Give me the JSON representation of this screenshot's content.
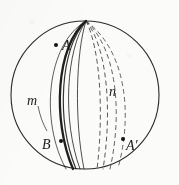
{
  "figure": {
    "caption": "",
    "background_color": "#fbfbfa",
    "ink_color": "#1f1f1f",
    "labels": [
      {
        "id": "A",
        "text": "A",
        "x": 62,
        "y": 50,
        "font_size": 14,
        "style": "italic"
      },
      {
        "id": "m",
        "text": "m",
        "x": 27,
        "y": 105,
        "font_size": 14,
        "style": "italic"
      },
      {
        "id": "B",
        "text": "B",
        "x": 42,
        "y": 149,
        "font_size": 14,
        "style": "italic"
      },
      {
        "id": "n",
        "text": "n",
        "x": 109,
        "y": 96,
        "font_size": 14,
        "style": "italic"
      },
      {
        "id": "Aprime",
        "text": "A′",
        "x": 126,
        "y": 150,
        "font_size": 14,
        "style": "italic"
      }
    ],
    "points": [
      {
        "id": "A",
        "x": 56,
        "y": 45,
        "r": 2.0,
        "filled": true
      },
      {
        "id": "B",
        "x": 61,
        "y": 141,
        "r": 2.0,
        "filled": true
      },
      {
        "id": "Aprime",
        "x": 123,
        "y": 139,
        "r": 2.0,
        "filled": true
      }
    ],
    "circle": {
      "center_x": 85,
      "center_y": 95,
      "radius": 74,
      "stroke_width": 1.1,
      "label": "sphere-outline"
    },
    "poles": {
      "top_x": 86,
      "top_y": 21,
      "bottom_x": 85,
      "bottom_y": 169
    },
    "solid_curves": [
      {
        "id": "m-heavy",
        "bulge": -30,
        "stroke_width": 2.3,
        "opacity": 1.0
      },
      {
        "id": "m-mid",
        "bulge": -25,
        "stroke_width": 1.2,
        "opacity": 0.92
      },
      {
        "id": "m-light",
        "bulge": -20,
        "stroke_width": 1.0,
        "opacity": 0.8
      },
      {
        "id": "m-inner",
        "bulge": -5,
        "stroke_width": 1.0,
        "opacity": 0.78
      }
    ],
    "dashed_curves": [
      {
        "id": "n-1",
        "bulge": 10,
        "stroke_width": 1.0,
        "dash": "4 4"
      },
      {
        "id": "n-2",
        "bulge": 20,
        "stroke_width": 1.0,
        "dash": "4 4"
      },
      {
        "id": "n-3",
        "bulge": 30,
        "stroke_width": 1.0,
        "dash": "4 4"
      },
      {
        "id": "n-4",
        "bulge": 40,
        "stroke_width": 1.0,
        "dash": "4 4"
      }
    ],
    "leader_line": {
      "id": "m-leader",
      "from_x": 38,
      "from_y": 108,
      "to_x": 46,
      "to_y": 128
    },
    "bleed_text_left": "",
    "bleed_text_right": ""
  }
}
